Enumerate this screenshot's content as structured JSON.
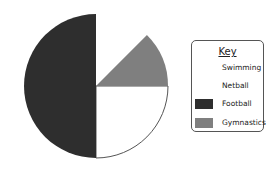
{
  "chart_data": {
    "type": "pie",
    "title": "",
    "legend_title": "Key",
    "legend_position": "right",
    "slices": [
      {
        "label": "Swimming",
        "value": 12.5,
        "color": "#ffffff",
        "start_deg": 45,
        "end_deg": 90
      },
      {
        "label": "Netball",
        "value": 25,
        "color": "#ffffff",
        "start_deg": -90,
        "end_deg": 0
      },
      {
        "label": "Football",
        "value": 50,
        "color": "#2e2e2e",
        "start_deg": 90,
        "end_deg": 270
      },
      {
        "label": "Gymnastics",
        "value": 12.5,
        "color": "#7f7f7f",
        "start_deg": 0,
        "end_deg": 45
      }
    ],
    "categories": [
      "Swimming",
      "Netball",
      "Football",
      "Gymnastics"
    ],
    "values": [
      12.5,
      25,
      50,
      12.5
    ],
    "unit": "percent (estimated from slice angles)"
  },
  "legend": {
    "title": "Key",
    "items": [
      {
        "label": "Swimming",
        "color": "#ffffff",
        "show_swatch": false
      },
      {
        "label": "Netball",
        "color": "#ffffff",
        "show_swatch": false
      },
      {
        "label": "Football",
        "color": "#2e2e2e",
        "show_swatch": true
      },
      {
        "label": "Gymnastics",
        "color": "#7f7f7f",
        "show_swatch": true
      }
    ]
  },
  "colors": {
    "football": "#2e2e2e",
    "gymnastics": "#7f7f7f",
    "outline": "#555555",
    "background": "#ffffff"
  }
}
